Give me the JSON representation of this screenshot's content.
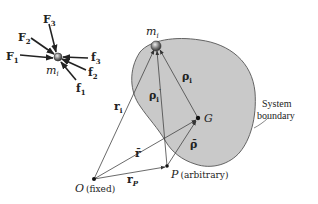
{
  "figure": {
    "free_body": {
      "mass_label": "m",
      "mass_sub": "i",
      "external_forces": [
        {
          "label": "F",
          "sub": "1"
        },
        {
          "label": "F",
          "sub": "2"
        },
        {
          "label": "F",
          "sub": "3"
        }
      ],
      "internal_forces": [
        {
          "label": "f",
          "sub": "1"
        },
        {
          "label": "f",
          "sub": "2"
        },
        {
          "label": "f",
          "sub": "3"
        }
      ]
    },
    "system": {
      "particle_label": "m",
      "particle_sub": "i",
      "center_of_mass": "G",
      "boundary_label_line1": "System",
      "boundary_label_line2": "boundary",
      "fill_color": "#c8c8c8",
      "outline_color": "#555555"
    },
    "points": {
      "origin": "O",
      "origin_note": "(fixed)",
      "ref_point": "P",
      "ref_note": "(arbitrary)"
    },
    "vectors": {
      "r_i": {
        "label": "r",
        "sub": "i"
      },
      "rho_i": {
        "label": "ρ",
        "sub": "i"
      },
      "rho_i_prime": {
        "label": "ρ",
        "sub": "i",
        "prime": "′"
      },
      "r_bar": {
        "label": "r̄"
      },
      "rho_bar": {
        "label": "ρ̄"
      },
      "r_P": {
        "label": "r",
        "sub": "P"
      }
    }
  }
}
